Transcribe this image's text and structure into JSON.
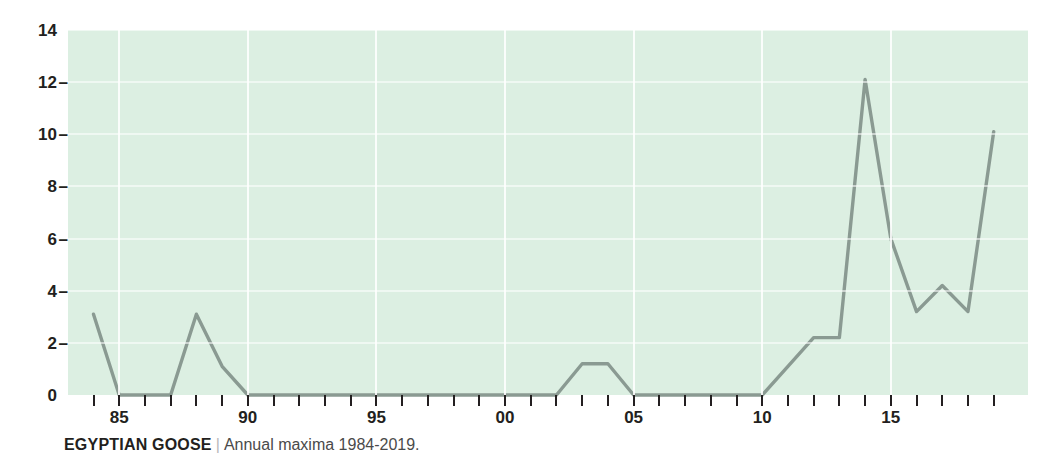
{
  "caption": {
    "species": "EGYPTIAN GOOSE",
    "separator": "|",
    "description": "Annual maxima 1984-2019."
  },
  "colors": {
    "plot_background": "#dcefe2",
    "gridline": "#ffffff",
    "line": "#8a9a92",
    "text": "#231f20"
  },
  "chart_data": {
    "type": "line",
    "title": "EGYPTIAN GOOSE",
    "subtitle": "Annual maxima 1984-2019.",
    "xlabel": "",
    "ylabel": "",
    "xlim": [
      1984,
      2019
    ],
    "ylim": [
      0,
      14
    ],
    "grid": true,
    "legend": "none",
    "y_ticks": [
      0,
      2,
      4,
      6,
      8,
      10,
      12,
      14
    ],
    "y_tick_labels": [
      "0",
      "2",
      "4",
      "6",
      "8",
      "10",
      "12",
      "14"
    ],
    "x_ticks": [
      1985,
      1990,
      1995,
      2000,
      2005,
      2010,
      2015
    ],
    "x_tick_labels": [
      "85",
      "90",
      "95",
      "00",
      "05",
      "10",
      "15"
    ],
    "x_minor_ticks_every": 1,
    "x": [
      1984,
      1985,
      1986,
      1987,
      1988,
      1989,
      1990,
      1991,
      1992,
      1993,
      1994,
      1995,
      1996,
      1997,
      1998,
      1999,
      2000,
      2001,
      2002,
      2003,
      2004,
      2005,
      2006,
      2007,
      2008,
      2009,
      2010,
      2011,
      2012,
      2013,
      2014,
      2015,
      2016,
      2017,
      2018,
      2019
    ],
    "values": [
      3.1,
      0,
      0,
      0,
      3.1,
      1.1,
      0,
      0,
      0,
      0,
      0,
      0,
      0,
      0,
      0,
      0,
      0,
      0,
      0,
      1.2,
      1.2,
      0,
      0,
      0,
      0,
      0,
      0,
      1.1,
      2.2,
      2.2,
      12.1,
      6.0,
      3.2,
      4.2,
      3.2,
      10.1
    ],
    "series": [
      {
        "name": "Annual maxima",
        "values": [
          3.1,
          0,
          0,
          0,
          3.1,
          1.1,
          0,
          0,
          0,
          0,
          0,
          0,
          0,
          0,
          0,
          0,
          0,
          0,
          0,
          1.2,
          1.2,
          0,
          0,
          0,
          0,
          0,
          0,
          1.1,
          2.2,
          2.2,
          12.1,
          6.0,
          3.2,
          4.2,
          3.2,
          10.1
        ]
      }
    ]
  }
}
